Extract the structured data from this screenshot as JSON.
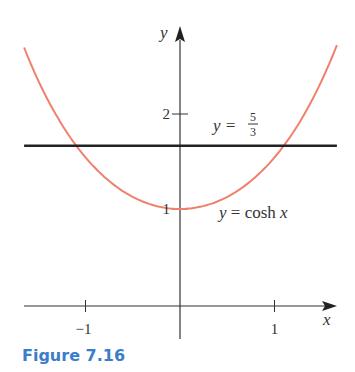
{
  "caption": "Figure 7.16",
  "chart_data": {
    "type": "line",
    "title": "",
    "xlabel": "x",
    "ylabel": "y",
    "xlim": [
      -1.68,
      1.68
    ],
    "ylim": [
      0,
      2.85
    ],
    "x_ticks": [
      {
        "value": -1,
        "label": "−1"
      },
      {
        "value": 1,
        "label": "1"
      }
    ],
    "y_ticks": [
      {
        "value": 1,
        "label": "1"
      },
      {
        "value": 2,
        "label": "2"
      }
    ],
    "grid": false,
    "series": [
      {
        "name": "y = cosh x",
        "function": "cosh(x)",
        "x_range": [
          -1.65,
          1.66
        ],
        "color": "#f0806e",
        "sample_points": [
          [
            -1.65,
            2.7
          ],
          [
            -1.0,
            1.54
          ],
          [
            -0.5,
            1.13
          ],
          [
            0,
            1.0
          ],
          [
            0.5,
            1.13
          ],
          [
            1.0,
            1.54
          ],
          [
            1.65,
            2.7
          ]
        ]
      },
      {
        "name": "y = 5/3",
        "function": "5/3",
        "x_range": [
          -1.65,
          1.66
        ],
        "color": "#222222",
        "sample_points": [
          [
            -1.65,
            1.6667
          ],
          [
            1.66,
            1.6667
          ]
        ]
      }
    ],
    "annotations": [
      {
        "text_lhs": "y =",
        "frac_num": "5",
        "frac_den": "3",
        "near": "horizontal line"
      },
      {
        "text": "y = cosh x",
        "near": "curve minimum"
      }
    ]
  }
}
